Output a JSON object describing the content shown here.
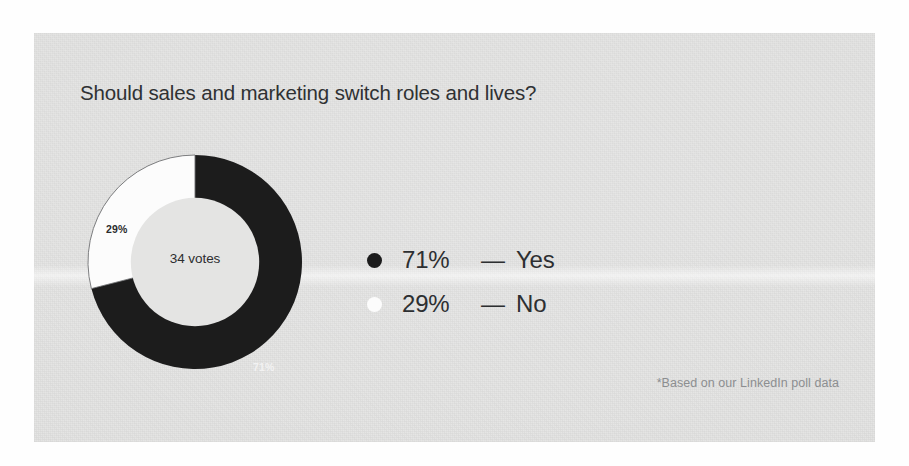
{
  "card": {
    "background_color": "#e4e4e3",
    "title": "Should sales and marketing switch roles and lives?",
    "footnote": "*Based on our LinkedIn poll data"
  },
  "donut": {
    "center_label": "34 votes",
    "slice_label_yes": "71%",
    "slice_label_no": "29%"
  },
  "legend": {
    "rows": [
      {
        "dot": "dark-dot-icon",
        "percent": "71%",
        "dash": "—",
        "name": "Yes",
        "color": "#1c1c1c"
      },
      {
        "dot": "light-dot-icon",
        "percent": "29%",
        "dash": "—",
        "name": "No",
        "color": "#fcfcfc"
      }
    ]
  },
  "chart_data": {
    "type": "pie",
    "title": "Should sales and marketing switch roles and lives?",
    "subtitle": "",
    "xlabel": "",
    "ylabel": "",
    "annotations": [
      "34 votes",
      "*Based on our LinkedIn poll data"
    ],
    "center_text": "34 votes",
    "total_votes": 34,
    "donut": true,
    "hole_ratio": 0.6,
    "start_angle_deg": 0,
    "direction": "clockwise",
    "legend_position": "right",
    "grid": false,
    "categories": [
      "Yes",
      "No"
    ],
    "values": [
      71,
      29
    ],
    "value_unit": "percent",
    "slices": [
      {
        "label": "Yes",
        "value": 71,
        "display": "71%",
        "color": "#1c1c1c",
        "label_color": "#f2f2f2"
      },
      {
        "label": "No",
        "value": 29,
        "display": "29%",
        "color": "#fcfcfc",
        "label_color": "#2b2c2e"
      }
    ]
  }
}
